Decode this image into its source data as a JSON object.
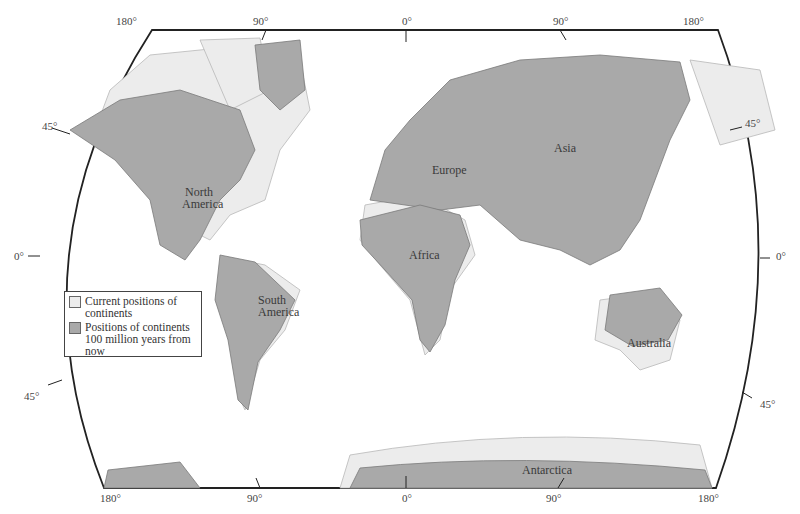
{
  "map": {
    "projection": "world map (Robinson-like) showing continental drift",
    "colors": {
      "current": "#ececec",
      "future": "#a9a9a9",
      "outline": "#222222"
    },
    "top_longitude_ticks": [
      "180°",
      "90°",
      "0°",
      "90°",
      "180°"
    ],
    "bottom_longitude_ticks": [
      "180°",
      "90°",
      "0°",
      "90°",
      "180°"
    ],
    "left_latitude_ticks": [
      "45°",
      "0°",
      "45°"
    ],
    "right_latitude_ticks": [
      "45°",
      "0°",
      "45°"
    ],
    "continent_labels": {
      "north_america": [
        "North",
        "America"
      ],
      "south_america": [
        "South",
        "America"
      ],
      "europe": "Europe",
      "asia": "Asia",
      "africa": "Africa",
      "australia": "Australia",
      "antarctica": "Antarctica"
    }
  },
  "legend": {
    "items": [
      {
        "label": "Current positions of continents",
        "color": "#ececec"
      },
      {
        "label": "Positions of continents 100 million years from now",
        "color": "#a9a9a9"
      }
    ]
  }
}
